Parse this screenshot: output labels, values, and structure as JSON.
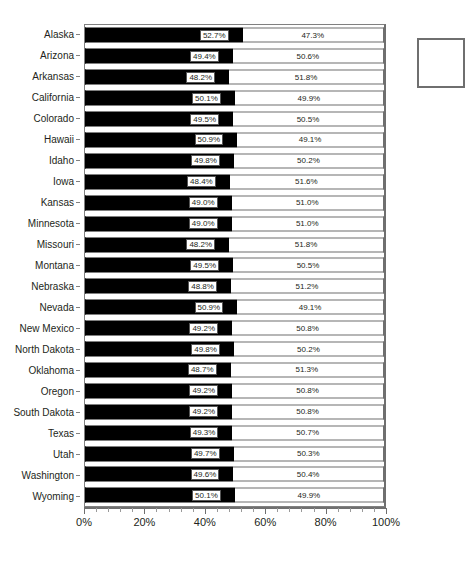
{
  "chart_data": {
    "type": "bar",
    "subtype": "100-percent-stacked-horizontal-bar",
    "title": "",
    "xlabel": "",
    "ylabel": "",
    "xlim": [
      0,
      100
    ],
    "grid": false,
    "legend_position": "right",
    "axis_tick_labels": [
      "0%",
      "20%",
      "40%",
      "60%",
      "80%",
      "100%"
    ],
    "axis_tick_values": [
      0,
      20,
      40,
      60,
      80,
      100
    ],
    "minor_ticks_per_interval": 4,
    "series": [
      {
        "name": "series-a",
        "color": "#000000",
        "values": [
          52.7,
          49.4,
          48.2,
          50.1,
          49.5,
          50.9,
          49.8,
          48.4,
          49.0,
          49.0,
          48.2,
          49.5,
          48.8,
          50.9,
          49.2,
          49.8,
          48.7,
          49.2,
          49.2,
          49.3,
          49.7,
          49.6,
          50.1
        ],
        "labels": [
          "52.7%",
          "49.4%",
          "48.2%",
          "50.1%",
          "49.5%",
          "50.9%",
          "49.8%",
          "48.4%",
          "49.0%",
          "49.0%",
          "48.2%",
          "49.5%",
          "48.8%",
          "50.9%",
          "49.2%",
          "49.8%",
          "48.7%",
          "49.2%",
          "49.2%",
          "49.3%",
          "49.7%",
          "49.6%",
          "50.1%"
        ]
      },
      {
        "name": "series-b",
        "color": "#ffffff",
        "values": [
          47.3,
          50.6,
          51.8,
          49.9,
          50.5,
          49.1,
          50.2,
          51.6,
          51.0,
          51.0,
          51.8,
          50.5,
          51.2,
          49.1,
          50.8,
          50.2,
          51.3,
          50.8,
          50.8,
          50.7,
          50.3,
          50.4,
          49.9
        ],
        "labels": [
          "47.3%",
          "50.6%",
          "51.8%",
          "49.9%",
          "50.5%",
          "49.1%",
          "50.2%",
          "51.6%",
          "51.0%",
          "51.0%",
          "51.8%",
          "50.5%",
          "51.2%",
          "49.1%",
          "50.8%",
          "50.2%",
          "51.3%",
          "50.8%",
          "50.8%",
          "50.7%",
          "50.3%",
          "50.4%",
          "49.9%"
        ]
      }
    ],
    "categories": [
      "Alaska",
      "Arizona",
      "Arkansas",
      "California",
      "Colorado",
      "Hawaii",
      "Idaho",
      "Iowa",
      "Kansas",
      "Minnesota",
      "Missouri",
      "Montana",
      "Nebraska",
      "Nevada",
      "New Mexico",
      "North Dakota",
      "Oklahoma",
      "Oregon",
      "South Dakota",
      "Texas",
      "Utah",
      "Washington",
      "Wyoming"
    ]
  },
  "legend": {
    "items": []
  },
  "title_fragment": ""
}
